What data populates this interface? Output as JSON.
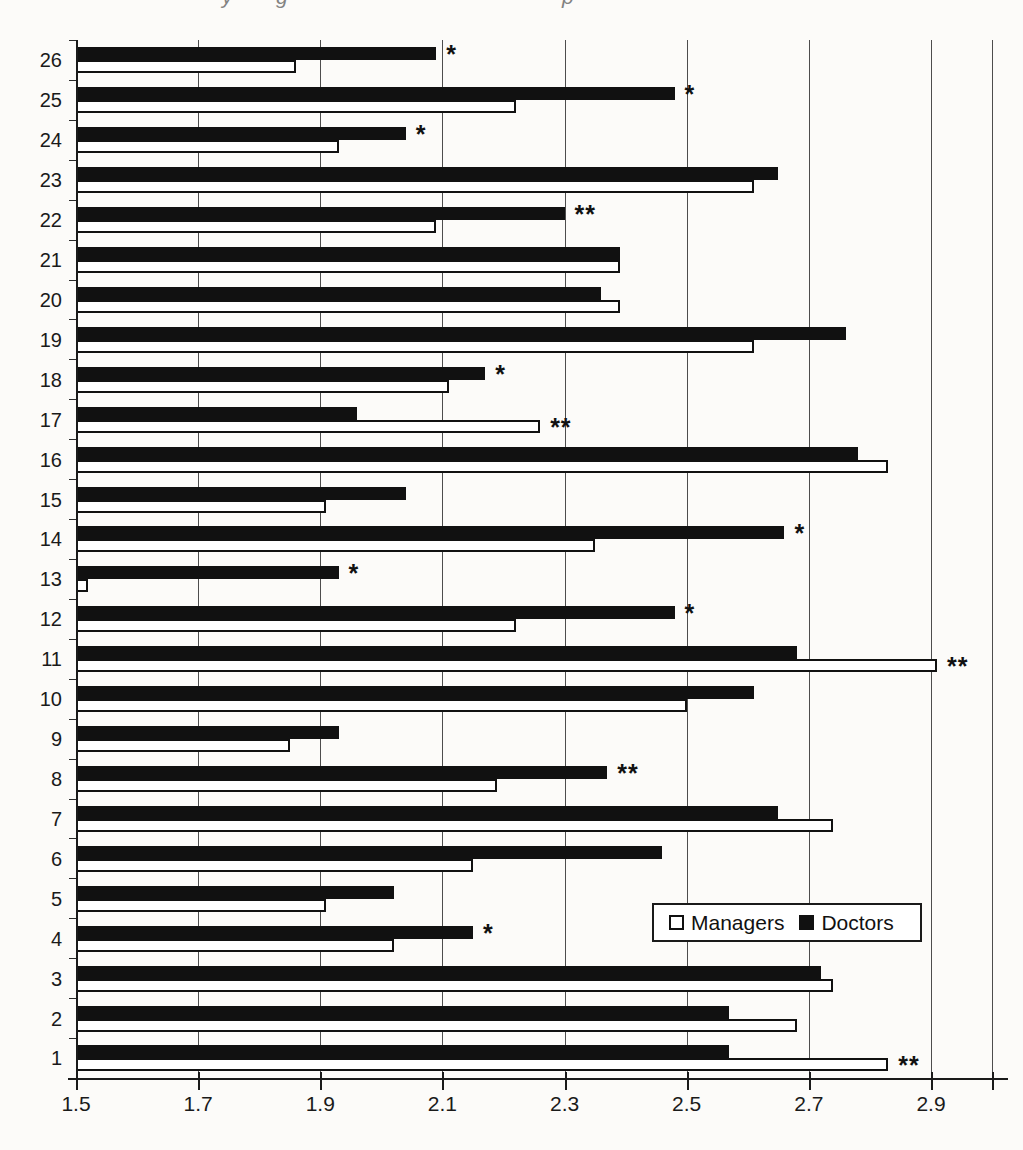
{
  "page_top_fragments": [
    "y",
    "g",
    "p"
  ],
  "chart_data": {
    "type": "bar",
    "orientation": "horizontal-grouped",
    "title": "",
    "xlabel": "",
    "ylabel": "",
    "x_min": 1.5,
    "x_max": 2.9,
    "x_axis_end": 3.0,
    "x_ticks": [
      1.5,
      1.7,
      1.9,
      2.1,
      2.3,
      2.5,
      2.7,
      2.9
    ],
    "x_tick_labels": [
      "1.5",
      "1.7",
      "1.9",
      "2.1",
      "2.3",
      "2.5",
      "2.7",
      "2.9"
    ],
    "grid": "vertical",
    "categories": [
      "26",
      "25",
      "24",
      "23",
      "22",
      "21",
      "20",
      "19",
      "18",
      "17",
      "16",
      "15",
      "14",
      "13",
      "12",
      "11",
      "10",
      "9",
      "8",
      "7",
      "6",
      "5",
      "4",
      "3",
      "2",
      "1"
    ],
    "bar_order_top_to_bottom": [
      "Doctors",
      "Managers"
    ],
    "series": [
      {
        "name": "Doctors",
        "fill": "#111111",
        "values": [
          2.09,
          2.48,
          2.04,
          2.65,
          2.3,
          2.39,
          2.36,
          2.76,
          2.17,
          1.96,
          2.78,
          2.04,
          2.66,
          1.93,
          2.48,
          2.68,
          2.61,
          1.93,
          2.37,
          2.65,
          2.46,
          2.02,
          2.15,
          2.72,
          2.57,
          2.57
        ]
      },
      {
        "name": "Managers",
        "fill": "#ffffff",
        "values": [
          1.86,
          2.22,
          1.93,
          2.61,
          2.09,
          2.39,
          2.39,
          2.61,
          2.11,
          2.26,
          2.83,
          1.91,
          2.35,
          1.52,
          2.22,
          2.91,
          2.5,
          1.85,
          2.19,
          2.74,
          2.15,
          1.91,
          2.02,
          2.74,
          2.68,
          2.83
        ]
      }
    ],
    "significance_markers": [
      {
        "category": "26",
        "marker": "*",
        "after_series": "Doctors"
      },
      {
        "category": "25",
        "marker": "*",
        "after_series": "Doctors"
      },
      {
        "category": "24",
        "marker": "*",
        "after_series": "Doctors"
      },
      {
        "category": "22",
        "marker": "**",
        "after_series": "Doctors"
      },
      {
        "category": "18",
        "marker": "*",
        "after_series": "Doctors"
      },
      {
        "category": "17",
        "marker": "**",
        "after_series": "Managers"
      },
      {
        "category": "14",
        "marker": "*",
        "after_series": "Doctors"
      },
      {
        "category": "13",
        "marker": "*",
        "after_series": "Doctors"
      },
      {
        "category": "12",
        "marker": "*",
        "after_series": "Doctors"
      },
      {
        "category": "11",
        "marker": "**",
        "after_series": "Managers"
      },
      {
        "category": "8",
        "marker": "**",
        "after_series": "Doctors"
      },
      {
        "category": "4",
        "marker": "*",
        "after_series": "Doctors"
      },
      {
        "category": "1",
        "marker": "**",
        "after_series": "Managers"
      }
    ],
    "legend": {
      "position": "inside-right",
      "items": [
        {
          "label": "Managers",
          "fill": "#ffffff"
        },
        {
          "label": "Doctors",
          "fill": "#111111"
        }
      ]
    },
    "colors": {
      "axis": "#1a1a1a",
      "grid": "#4d4d4d",
      "text": "#1a1a1a"
    }
  }
}
